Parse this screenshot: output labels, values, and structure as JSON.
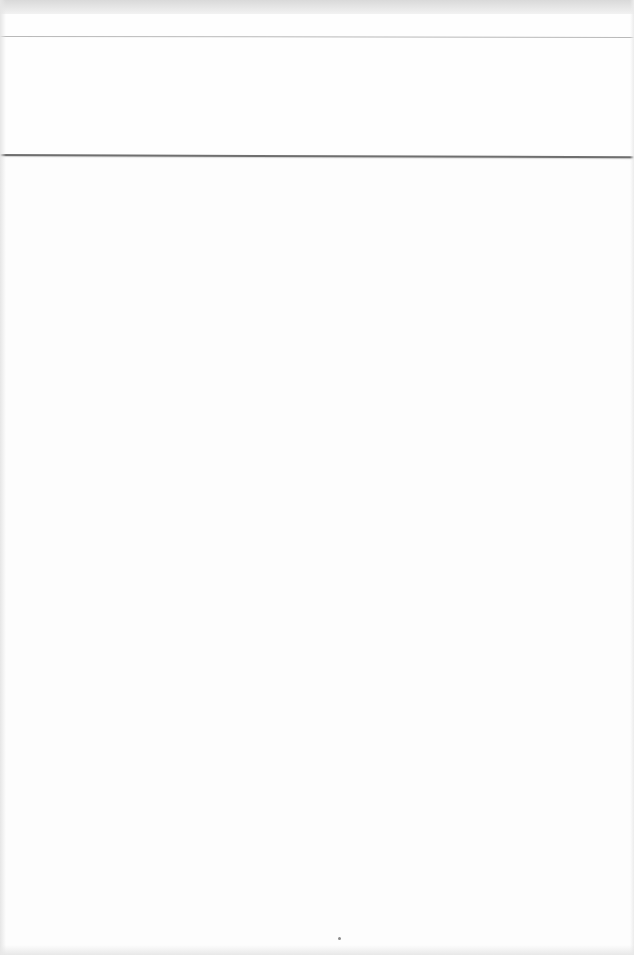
{
  "document": {
    "type": "blank notepad page",
    "header_text": "",
    "body_text": ""
  },
  "colors": {
    "paper": "#fdfdfd",
    "fold_line": "#6f6f6f",
    "thin_line": "#b9b9b9",
    "top_strip": "#d9d9d9"
  }
}
